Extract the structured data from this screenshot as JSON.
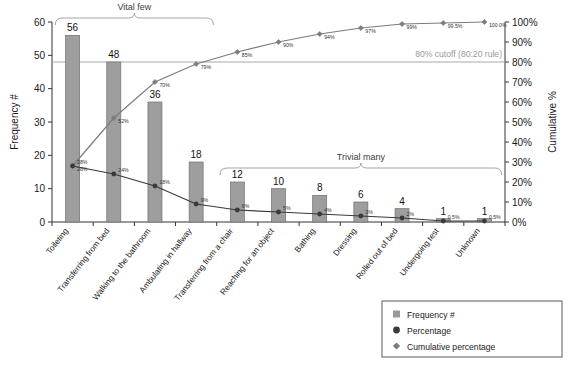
{
  "chart_data": {
    "type": "bar",
    "title": "",
    "subtitle": "",
    "xlabel": "",
    "ylabel": "Frequency #",
    "y2label": "Cumulative %",
    "ylim": [
      0,
      60
    ],
    "y2lim": [
      0,
      100
    ],
    "grid": false,
    "legend_position": "bottom-right",
    "categories": [
      "Toileting",
      "Transferring from bed",
      "Walking to the bathroom",
      "Ambulating in hallway",
      "Transferring from a chair",
      "Reaching for an object",
      "Bathing",
      "Dressing",
      "Rolled out of bed",
      "Undergoing test",
      "Unknown"
    ],
    "series": [
      {
        "name": "Frequency #",
        "type": "bar",
        "axis": "left",
        "color": "#8f8f8f",
        "values": [
          56,
          48,
          36,
          18,
          12,
          10,
          8,
          6,
          4,
          1,
          1
        ],
        "value_labels": [
          "56",
          "48",
          "36",
          "18",
          "12",
          "10",
          "8",
          "6",
          "4",
          "1",
          "1"
        ]
      },
      {
        "name": "Percentage",
        "type": "line",
        "axis": "right",
        "color": "#3a3a3a",
        "marker": "circle",
        "values": [
          28,
          24,
          18,
          9,
          6,
          5,
          4,
          3,
          2,
          0.5,
          0.5
        ],
        "value_labels": [
          "28%",
          "24%",
          "18%",
          "9%",
          "6%",
          "5%",
          "4%",
          "3%",
          "2%",
          "0.5%",
          "0.5%"
        ]
      },
      {
        "name": "Cumulative percentage",
        "type": "line",
        "axis": "right",
        "color": "#7c7c7c",
        "marker": "diamond",
        "values": [
          28,
          52,
          70,
          79,
          85,
          90,
          94,
          97,
          99,
          99.5,
          100
        ],
        "value_labels": [
          "28%",
          "52%",
          "70%",
          "79%",
          "85%",
          "90%",
          "94%",
          "97%",
          "99%",
          "99.5%",
          "100.0%"
        ]
      }
    ],
    "y_ticks": [
      "0",
      "10",
      "20",
      "30",
      "40",
      "50",
      "60"
    ],
    "y2_ticks": [
      "0%",
      "10%",
      "20%",
      "30%",
      "40%",
      "50%",
      "60%",
      "70%",
      "80%",
      "90%",
      "100%"
    ],
    "reference_line": {
      "label": "80% cutoff (80:20 rule)",
      "value": 80,
      "axis": "right",
      "color": "#a8a8a8"
    },
    "annotations": [
      {
        "label": "Vital few",
        "from_index": 0,
        "to_index": 3
      },
      {
        "label": "Trivial many",
        "from_index": 4,
        "to_index": 10
      }
    ]
  },
  "legend": {
    "items": [
      {
        "label": "Frequency #",
        "marker": "square",
        "color": "#9a9a9a"
      },
      {
        "label": "Percentage",
        "marker": "circle",
        "color": "#3a3a3a"
      },
      {
        "label": "Cumulative percentage",
        "marker": "diamond",
        "color": "#7c7c7c"
      }
    ]
  },
  "axes": {
    "left_title": "Frequency #",
    "right_title": "Cumulative %"
  }
}
